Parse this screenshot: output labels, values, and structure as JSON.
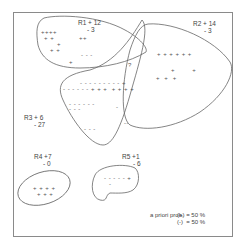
{
  "regions": [
    {
      "id": "R1",
      "label": "R1 + 12",
      "neg": "- 3"
    },
    {
      "id": "R2",
      "label": "R2 + 14",
      "neg": "- 3"
    },
    {
      "id": "R3",
      "label": "R3 + 6",
      "neg": "- 27"
    },
    {
      "id": "R4",
      "label": "R4 +7",
      "neg": "- 0"
    },
    {
      "id": "R5",
      "label": "R5 +1",
      "neg": "- 6"
    }
  ],
  "points": {
    "r1_row1": "++++",
    "r1_row2": "+ +",
    "r1_row3": "+",
    "r1_row4": "+ +",
    "r1_row5": "+",
    "r1_mid": "++",
    "r1_neg": "- - -",
    "overlap_mark": "?",
    "r2_row1": "+ + + + + +",
    "r2_row2": "+        +",
    "r2_row3": "+  +  +",
    "r3_row1": "- - - - - - - - - +",
    "r3_row2": "- - - - - - + + +  + + + +",
    "r3_row3": "- - - - - -",
    "r3_row3b": "- - -",
    "r3_row4": "- - -",
    "r3_right1": "-",
    "r3_right2": "--",
    "r4_row1": "+ + + +",
    "r4_row2": "+ + +",
    "r5_row1": "- - - - - +",
    "r5_row2": "-"
  },
  "legend": {
    "title": "a priori prob.",
    "pos": "(+) = 50 %",
    "neg": "(-)  = 50 %"
  }
}
